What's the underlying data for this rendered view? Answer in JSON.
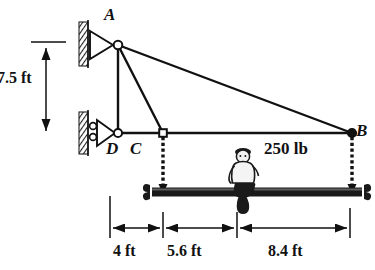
{
  "figure": {
    "background_color": "#ffffff",
    "line_color": "#111111"
  },
  "joints": [
    {
      "id": "A",
      "label": "A",
      "x": 118,
      "y": 45,
      "support": "pin",
      "wall": "left"
    },
    {
      "id": "D",
      "label": "D",
      "x": 118,
      "y": 133,
      "support": "roller",
      "wall": "left"
    },
    {
      "id": "C",
      "label": "C",
      "x": 163,
      "y": 133,
      "support": "none"
    },
    {
      "id": "B",
      "label": "B",
      "x": 352,
      "y": 133,
      "support": "none"
    }
  ],
  "members": [
    {
      "from": "A",
      "to": "D"
    },
    {
      "from": "A",
      "to": "C"
    },
    {
      "from": "A",
      "to": "B"
    },
    {
      "from": "D",
      "to": "C"
    },
    {
      "from": "C",
      "to": "B"
    }
  ],
  "hangers": [
    {
      "from": "C",
      "type": "chain",
      "to_y": 192
    },
    {
      "from": "B",
      "type": "chain",
      "to_y": 192
    }
  ],
  "beam": {
    "name": "suspended-beam",
    "x1": 152,
    "x2": 362,
    "y": 192,
    "thickness": 9
  },
  "person": {
    "name": "seated-person",
    "x": 243,
    "y": 192,
    "description": "person seated on beam"
  },
  "load": {
    "label": "250 lb",
    "value": 250,
    "unit": "lb"
  },
  "vertical_dimension": {
    "label": "7.5 ft",
    "value": 7.5,
    "unit": "ft",
    "from_y": 46,
    "to_y": 133,
    "x": 46
  },
  "horizontal_dimensions": {
    "line_y": 228,
    "ticks": [
      110,
      163,
      237,
      350
    ],
    "segments": [
      {
        "label": "4 ft",
        "value": 4,
        "unit": "ft",
        "x1": 110,
        "x2": 163
      },
      {
        "label": "5.6 ft",
        "value": 5.6,
        "unit": "ft",
        "x1": 163,
        "x2": 237
      },
      {
        "label": "8.4 ft",
        "value": 8.4,
        "unit": "ft",
        "x1": 237,
        "x2": 350
      }
    ]
  }
}
